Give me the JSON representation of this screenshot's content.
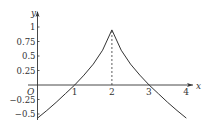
{
  "chart_data": {
    "type": "line",
    "title": "",
    "xlabel": "x",
    "ylabel": "y",
    "origin_label": "O",
    "xlim": [
      0,
      4.2
    ],
    "ylim": [
      -0.6,
      1.1
    ],
    "x_ticks": [
      1,
      2,
      3,
      4
    ],
    "x_tick_labels": [
      "1",
      "2",
      "3",
      "4"
    ],
    "y_ticks": [
      1,
      0.75,
      0.5,
      0.25,
      -0.25,
      -0.5
    ],
    "y_tick_labels": [
      "1",
      "0.75",
      "0.5",
      "0.25",
      "−0.25",
      "−0.5"
    ],
    "grid": false,
    "legend": null,
    "series": [
      {
        "name": "f(x)",
        "x": [
          0,
          0.25,
          0.5,
          0.75,
          1,
          1.25,
          1.5,
          1.75,
          2,
          2.25,
          2.5,
          2.75,
          3,
          3.25,
          3.5,
          3.75,
          4
        ],
        "y": [
          -0.57,
          -0.44,
          -0.3,
          -0.15,
          0,
          0.17,
          0.36,
          0.6,
          0.95,
          0.6,
          0.36,
          0.17,
          0,
          -0.15,
          -0.3,
          -0.44,
          -0.57
        ]
      }
    ],
    "annotations": [
      {
        "type": "dashed-vertical",
        "x": 2,
        "from_y": 0,
        "to_y": 0.95
      }
    ]
  },
  "colors": {
    "line": "#333333",
    "axis": "#333333"
  }
}
